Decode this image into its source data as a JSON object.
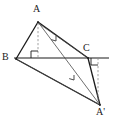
{
  "diagram": {
    "canvas": {
      "width": 113,
      "height": 121
    },
    "background_color": "#ffffff",
    "stroke_color": "#1a1a1a",
    "thin_stroke_color": "#555555",
    "dash_color": "#888888",
    "points": {
      "A": {
        "label": "A",
        "x": 38,
        "y": 22,
        "label_x": 33,
        "label_y": 4
      },
      "B": {
        "label": "B",
        "x": 16,
        "y": 59,
        "label_x": 2,
        "label_y": 52
      },
      "C": {
        "label": "C",
        "x": 88,
        "y": 58,
        "label_x": 83,
        "label_y": 43
      },
      "Ap": {
        "label": "A'",
        "x": 100,
        "y": 105,
        "label_x": 96,
        "label_y": 107
      },
      "D": {
        "label": "",
        "x": 38,
        "y": 58,
        "label_x": 0,
        "label_y": 0
      },
      "E": {
        "label": "",
        "x": 98,
        "y": 58,
        "label_x": 0,
        "label_y": 0
      }
    },
    "baseline": {
      "x1": 14,
      "y1": 58,
      "x2": 109,
      "y2": 58
    },
    "segments": [
      {
        "name": "segment-AB",
        "from": "A",
        "to": "B",
        "weight": "thick"
      },
      {
        "name": "segment-AC",
        "from": "A",
        "to": "C",
        "weight": "thick"
      },
      {
        "name": "segment-BC",
        "from": "B",
        "to": "C",
        "weight": "thick"
      },
      {
        "name": "segment-BAp",
        "from": "B",
        "to": "Ap",
        "weight": "thick"
      },
      {
        "name": "segment-CAp",
        "from": "C",
        "to": "Ap",
        "weight": "thick"
      },
      {
        "name": "segment-AAp",
        "from": "A",
        "to": "Ap",
        "weight": "thin"
      },
      {
        "name": "segment-BAp2",
        "from": "B",
        "to": "Ap",
        "weight": "thin"
      }
    ],
    "dashed_lines": [
      {
        "name": "altitude-A-to-D",
        "x1": 38,
        "y1": 23,
        "x2": 38,
        "y2": 58
      },
      {
        "name": "vertical-E-to-Ap",
        "x1": 98,
        "y1": 58,
        "x2": 98,
        "y2": 104
      }
    ],
    "right_angles": [
      {
        "name": "right-angle-at-D",
        "x": 38,
        "y": 58,
        "size": 7,
        "dir_x": -1,
        "dir_y": -1
      },
      {
        "name": "right-angle-at-E",
        "x": 98,
        "y": 58,
        "size": 7,
        "dir_x": -1,
        "dir_y": 1
      }
    ],
    "arrow_markers": [
      {
        "name": "arrow-on-AAp-upper",
        "x": 56,
        "y": 41,
        "angle": 56
      },
      {
        "name": "arrow-on-AAp-lower",
        "x": 74,
        "y": 80,
        "angle": 56
      }
    ]
  }
}
